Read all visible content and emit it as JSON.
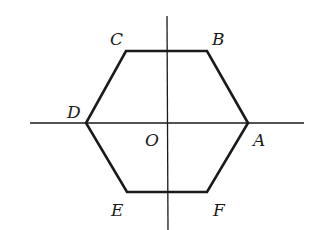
{
  "diagram": {
    "colors": {
      "stroke": "#1a1a1a",
      "background": "#ffffff"
    },
    "axes": {
      "horizontal": {
        "x1": 30,
        "y1": 123,
        "x2": 304,
        "y2": 123
      },
      "vertical": {
        "x1": 167,
        "y1": 16,
        "x2": 168,
        "y2": 230
      }
    },
    "vertices": {
      "A": {
        "x": 248,
        "y": 123
      },
      "B": {
        "x": 207,
        "y": 51
      },
      "C": {
        "x": 126,
        "y": 51
      },
      "D": {
        "x": 86,
        "y": 123
      },
      "E": {
        "x": 127,
        "y": 192
      },
      "F": {
        "x": 207,
        "y": 192
      }
    },
    "labels": {
      "A": "A",
      "B": "B",
      "C": "C",
      "D": "D",
      "E": "E",
      "F": "F",
      "O": "O"
    }
  }
}
